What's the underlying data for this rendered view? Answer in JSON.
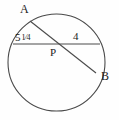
{
  "figure": {
    "type": "circle-with-intersecting-chords",
    "background_color": "#fefefe",
    "stroke_color": "#4a4a4a",
    "text_color": "#1c1c1c",
    "points": {
      "A": "A",
      "B": "B",
      "P": "P"
    },
    "segment_labels": {
      "left_chord_part": {
        "whole": "5",
        "fraction_numerator": "1",
        "fraction_denominator": "4",
        "full_text": "5 1/4"
      },
      "right_chord_part": "4"
    },
    "geometry": {
      "circle": {
        "cx": 56.5,
        "cy": 62.5,
        "r": 48.5
      },
      "horizontal_chord": {
        "x1": 13,
        "y1": 44,
        "x2": 100,
        "y2": 44
      },
      "diagonal_chord": {
        "x1": 30,
        "y1": 21,
        "x2": 96,
        "y2": 73
      },
      "intersection_point": {
        "x": 57,
        "y": 44
      }
    }
  }
}
